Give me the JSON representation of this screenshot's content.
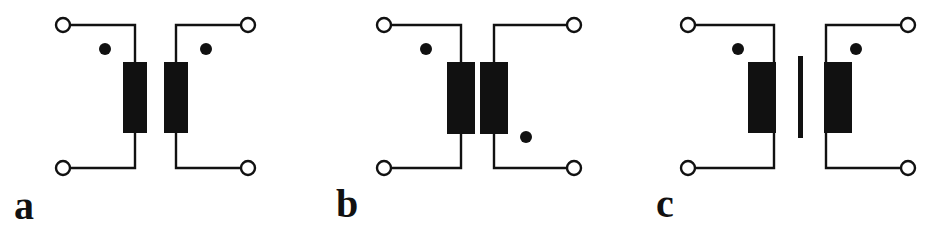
{
  "figure": {
    "width": 942,
    "height": 229,
    "background_color": "#ffffff",
    "ink_color": "#111111",
    "panel_count": 3
  },
  "panels": [
    {
      "id": "a",
      "label": "a",
      "description": "Air-core transformer, both polarity dots at top (additive polarity), no core bar",
      "core": "none",
      "dots": [
        {
          "side": "primary",
          "position": "top-left",
          "cx": 105,
          "cy": 49,
          "r": 6
        },
        {
          "side": "secondary",
          "position": "top-right",
          "cx": 206,
          "cy": 49,
          "r": 6
        }
      ],
      "terminals": [
        {
          "name": "primary-top",
          "cx": 63,
          "cy": 25,
          "r": 7
        },
        {
          "name": "primary-bottom",
          "cx": 63,
          "cy": 168,
          "r": 7
        },
        {
          "name": "secondary-top",
          "cx": 248,
          "cy": 25,
          "r": 7
        },
        {
          "name": "secondary-bottom",
          "cx": 248,
          "cy": 168,
          "r": 7
        }
      ],
      "windings": [
        {
          "name": "primary-winding",
          "x": 123,
          "y": 62,
          "w": 24,
          "h": 71
        },
        {
          "name": "secondary-winding",
          "x": 164,
          "y": 62,
          "w": 24,
          "h": 71
        }
      ]
    },
    {
      "id": "b",
      "label": "b",
      "description": "Air-core transformer, primary dot at top-left and secondary dot at bottom-right (subtractive polarity), no core bar",
      "core": "none",
      "dots": [
        {
          "side": "primary",
          "position": "top-left",
          "cx": 112,
          "cy": 49,
          "r": 6
        },
        {
          "side": "secondary",
          "position": "bottom-right",
          "cx": 212,
          "cy": 137,
          "r": 6
        }
      ],
      "terminals": [
        {
          "name": "primary-top",
          "cx": 70,
          "cy": 25,
          "r": 7
        },
        {
          "name": "primary-bottom",
          "cx": 70,
          "cy": 168,
          "r": 7
        },
        {
          "name": "secondary-top",
          "cx": 260,
          "cy": 25,
          "r": 7
        },
        {
          "name": "secondary-bottom",
          "cx": 260,
          "cy": 168,
          "r": 7
        }
      ],
      "windings": [
        {
          "name": "primary-winding",
          "x": 133,
          "y": 62,
          "w": 28,
          "h": 72
        },
        {
          "name": "secondary-winding",
          "x": 166,
          "y": 62,
          "w": 28,
          "h": 72
        }
      ]
    },
    {
      "id": "c",
      "label": "c",
      "description": "Iron-core transformer with single vertical core bar between windings, both polarity dots at top (additive polarity)",
      "core": "single-vertical-bar",
      "core_bar": {
        "x": 170,
        "y": 56,
        "w": 5,
        "h": 82
      },
      "dots": [
        {
          "side": "primary",
          "position": "top-left",
          "cx": 110,
          "cy": 49,
          "r": 6
        },
        {
          "side": "secondary",
          "position": "top-right",
          "cx": 228,
          "cy": 49,
          "r": 6
        }
      ],
      "terminals": [
        {
          "name": "primary-top",
          "cx": 60,
          "cy": 25,
          "r": 7
        },
        {
          "name": "primary-bottom",
          "cx": 60,
          "cy": 168,
          "r": 7
        },
        {
          "name": "secondary-top",
          "cx": 280,
          "cy": 25,
          "r": 7
        },
        {
          "name": "secondary-bottom",
          "cx": 280,
          "cy": 168,
          "r": 7
        }
      ],
      "windings": [
        {
          "name": "primary-winding",
          "x": 120,
          "y": 62,
          "w": 28,
          "h": 71
        },
        {
          "name": "secondary-winding",
          "x": 196,
          "y": 62,
          "w": 28,
          "h": 71
        }
      ]
    }
  ]
}
